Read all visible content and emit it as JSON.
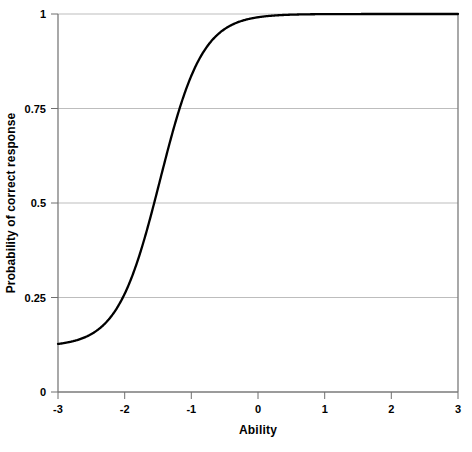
{
  "chart_data": {
    "type": "line",
    "title": "",
    "xlabel": "Ability",
    "ylabel": "Probability of correct response",
    "xlim": [
      -3,
      3
    ],
    "ylim": [
      0,
      1
    ],
    "xticks": [
      "-3",
      "-2",
      "-1",
      "0",
      "1",
      "2",
      "3"
    ],
    "xtick_values": [
      -3,
      -2,
      -1,
      0,
      1,
      2,
      3
    ],
    "yticks": [
      "0",
      "0.25",
      "0.5",
      "0.75",
      "1"
    ],
    "ytick_values": [
      0,
      0.25,
      0.5,
      0.75,
      1
    ],
    "grid": "horizontal",
    "legend": "none",
    "series": [
      {
        "name": "Item characteristic curve",
        "color": "#000000",
        "line_width": 2.3,
        "model": "3PL item response function",
        "parameters": {
          "discrimination_a": 1.85,
          "difficulty_b": -1.47,
          "guessing_c": 0.12
        },
        "x": [
          -3,
          -2.75,
          -2.5,
          -2.25,
          -2,
          -1.75,
          -1.5,
          -1.25,
          -1,
          -0.75,
          -0.5,
          -0.25,
          0,
          0.25,
          0.5,
          0.75,
          1,
          1.25,
          1.5,
          1.75,
          2,
          2.25,
          2.5,
          2.75,
          3
        ],
        "values": [
          0.12,
          0.131,
          0.149,
          0.177,
          0.219,
          0.28,
          0.364,
          0.468,
          0.586,
          0.7,
          0.795,
          0.866,
          0.915,
          0.947,
          0.967,
          0.98,
          0.988,
          0.993,
          0.995,
          0.997,
          0.998,
          0.999,
          0.999,
          1.0,
          1.0
        ]
      }
    ],
    "annotations": []
  },
  "axis": {
    "frame_color": "#7a7a7a",
    "grid_color": "#bdbdbd",
    "tick_color": "#6f6f6f"
  },
  "artifact": {
    "text": ""
  }
}
